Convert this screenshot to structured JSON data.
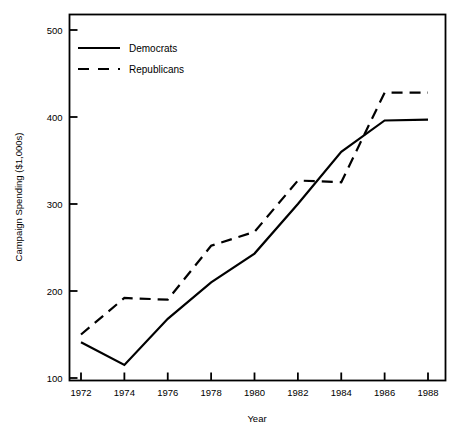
{
  "chart_data": {
    "type": "line",
    "title": "",
    "xlabel": "Year",
    "ylabel": "Campaign Spending ($1,000s)",
    "x": [
      1972,
      1974,
      1976,
      1978,
      1980,
      1982,
      1984,
      1986,
      1988
    ],
    "xtick_labels": [
      "1972",
      "1974",
      "1976",
      "1978",
      "1980",
      "1982",
      "1984",
      "1986",
      "1988"
    ],
    "ytick_labels": [
      "100",
      "200",
      "300",
      "400",
      "500"
    ],
    "ytick_values": [
      100,
      200,
      300,
      400,
      500
    ],
    "xlim": [
      1972,
      1988
    ],
    "ylim": [
      100,
      500
    ],
    "grid": false,
    "legend_position": "upper-left-inside",
    "series": [
      {
        "name": "Democrats",
        "style": "solid",
        "color": "#000000",
        "values": [
          141,
          115,
          168,
          210,
          243,
          300,
          360,
          396,
          397
        ]
      },
      {
        "name": "Republicans",
        "style": "dashed",
        "color": "#000000",
        "values": [
          150,
          192,
          190,
          252,
          268,
          327,
          325,
          428,
          428
        ]
      }
    ]
  },
  "legend": {
    "entries": [
      {
        "label": "Democrats",
        "style": "solid"
      },
      {
        "label": "Republicans",
        "style": "dashed"
      }
    ]
  },
  "axes": {
    "x_title": "Year",
    "y_title": "Campaign Spending ($1,000s)"
  }
}
